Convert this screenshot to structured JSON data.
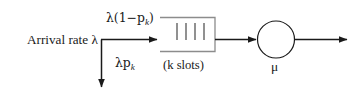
{
  "diagram": {
    "type": "queueing-system-block-diagram",
    "background_color": "#ffffff",
    "stroke_color": "#1a1a1a",
    "labels": {
      "arrival_rate": "Arrival rate λ",
      "arrival_rate_symbol": "λ",
      "admitted_flow": "λ(1−p",
      "admitted_flow_subscript": "k",
      "admitted_flow_close": ")",
      "blocked_flow": "λp",
      "blocked_flow_subscript": "k",
      "queue_capacity": "(k slots)",
      "service_rate": "μ"
    },
    "queue_box": {
      "slot_count": 4,
      "open_side": "left",
      "x": 160,
      "y": 17,
      "width": 55,
      "height": 35
    },
    "server": {
      "shape": "circle",
      "cx": 276,
      "cy": 39.5,
      "r": 18.5,
      "rate_symbol": "μ"
    },
    "flows": [
      {
        "name": "arrival-flow",
        "from_x": 101,
        "to_x": 158,
        "y": 39.5,
        "direction": "right",
        "label": "λ(1−p_k)"
      },
      {
        "name": "blocking-flow",
        "x": 101,
        "from_y": 39.5,
        "to_y": 88,
        "direction": "down",
        "label": "λp_k"
      },
      {
        "name": "queue-to-server-flow",
        "from_x": 215,
        "to_x": 257,
        "y": 39.5,
        "direction": "right"
      },
      {
        "name": "departure-flow",
        "from_x": 295,
        "to_x": 348,
        "y": 39.5,
        "direction": "right"
      }
    ]
  }
}
